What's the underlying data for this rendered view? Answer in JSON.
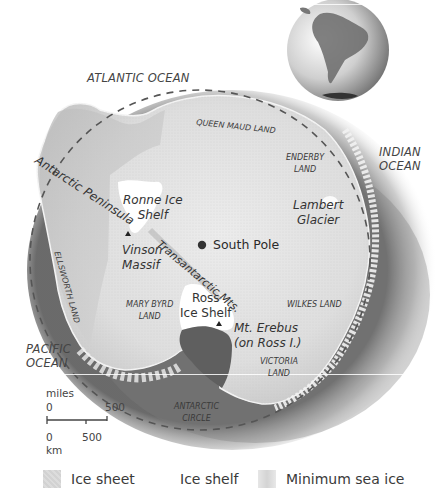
{
  "map": {
    "oceans": [
      {
        "id": "atlantic",
        "label": "ATLANTIC OCEAN"
      },
      {
        "id": "indian",
        "label_lines": [
          "INDIAN",
          "OCEAN"
        ]
      },
      {
        "id": "pacific",
        "label_lines": [
          "PACIFIC",
          "OCEAN"
        ]
      }
    ],
    "regions": [
      {
        "id": "queen-maud",
        "label": "QUEEN MAUD LAND"
      },
      {
        "id": "enderby",
        "label_lines": [
          "ENDERBY",
          "LAND"
        ]
      },
      {
        "id": "ellsworth",
        "label": "ELLSWORTH LAND"
      },
      {
        "id": "mary-byrd",
        "label_lines": [
          "MARY BYRD",
          "LAND"
        ]
      },
      {
        "id": "wilkes",
        "label": "WILKES LAND"
      },
      {
        "id": "victoria",
        "label_lines": [
          "VICTORIA",
          "LAND"
        ]
      }
    ],
    "features": [
      {
        "id": "antarctic-peninsula",
        "label": "Antarctic Peninsula"
      },
      {
        "id": "ronne",
        "label_lines": [
          "Ronne Ice",
          "Shelf"
        ]
      },
      {
        "id": "vinson",
        "label_lines": [
          "Vinson",
          "Massif"
        ]
      },
      {
        "id": "transantarctic",
        "label": "Transantarctic Mts."
      },
      {
        "id": "lambert",
        "label_lines": [
          "Lambert",
          "Glacier"
        ]
      },
      {
        "id": "ross",
        "label_lines": [
          "Ross",
          "Ice Shelf"
        ]
      },
      {
        "id": "erebus",
        "label_lines": [
          "Mt. Erebus",
          "(on Ross I.)"
        ]
      }
    ],
    "south_pole": {
      "label": "South Pole"
    },
    "antarctic_circle": {
      "label_lines": [
        "ANTARCTIC",
        "CIRCLE"
      ]
    },
    "locator_globe": {
      "label": "South America locator globe"
    }
  },
  "scale_bar": {
    "miles_label": "miles",
    "miles_start": "0",
    "miles_end": "500",
    "km_start": "0",
    "km_mid": "500",
    "km_label": "km"
  },
  "legend": {
    "items": [
      {
        "id": "ice-sheet",
        "label": "Ice sheet",
        "color": "#d6d6d6"
      },
      {
        "id": "ice-shelf",
        "label": "Ice shelf",
        "color": "#ffffff"
      },
      {
        "id": "min-sea-ice",
        "label": "Minimum sea ice",
        "color": "#dedede"
      }
    ]
  }
}
